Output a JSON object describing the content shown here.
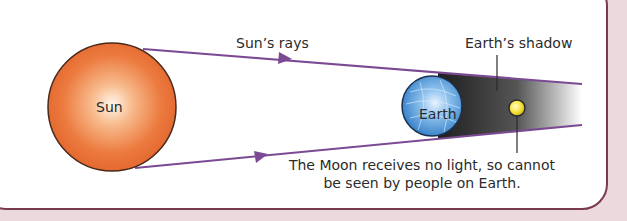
{
  "diagram": {
    "labels": {
      "sun": "Sun",
      "sun_rays": "Sun’s rays",
      "earth": "Earth",
      "earth_shadow": "Earth’s shadow",
      "moon_caption_line1": "The Moon receives no light, so cannot",
      "moon_caption_line2": "be seen by people on Earth."
    },
    "colors": {
      "background": "#ecd9dd",
      "panel_border": "#7a3a4e",
      "ray_line": "#7b4a93",
      "sun": "#e8733a",
      "earth": "#4a8fd0",
      "moon": "#f2e23a",
      "shadow": "#3a3a3a"
    }
  }
}
